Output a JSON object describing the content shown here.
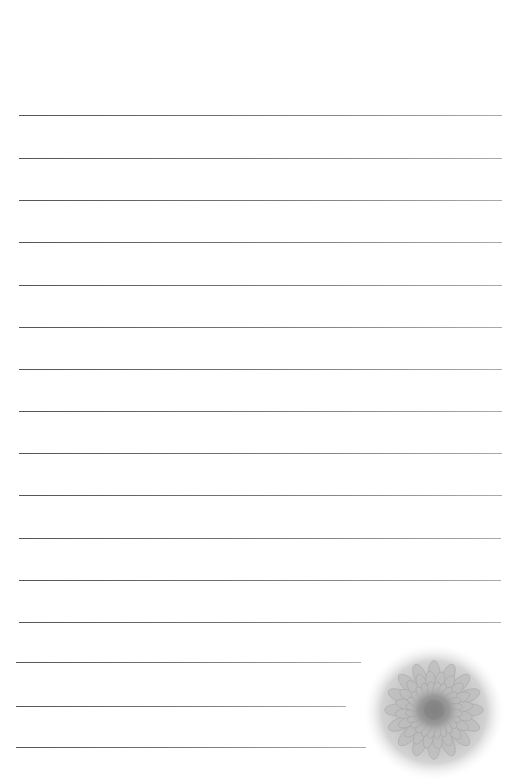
{
  "document": {
    "type": "lined-paper",
    "background_color": "#ffffff",
    "line_color": "#6e6e6e",
    "lines": [
      {
        "y": 115,
        "x1": 19,
        "x2": 502
      },
      {
        "y": 158,
        "x1": 19,
        "x2": 502
      },
      {
        "y": 200,
        "x1": 19,
        "x2": 502
      },
      {
        "y": 242,
        "x1": 19,
        "x2": 502
      },
      {
        "y": 285,
        "x1": 19,
        "x2": 502
      },
      {
        "y": 327,
        "x1": 19,
        "x2": 502
      },
      {
        "y": 369,
        "x1": 19,
        "x2": 502
      },
      {
        "y": 411,
        "x1": 19,
        "x2": 502
      },
      {
        "y": 453,
        "x1": 19,
        "x2": 502
      },
      {
        "y": 495,
        "x1": 19,
        "x2": 502
      },
      {
        "y": 538,
        "x1": 19,
        "x2": 501
      },
      {
        "y": 580,
        "x1": 19,
        "x2": 501
      },
      {
        "y": 622,
        "x1": 19,
        "x2": 501
      },
      {
        "y": 662,
        "x1": 16,
        "x2": 361
      },
      {
        "y": 706,
        "x1": 16,
        "x2": 346
      },
      {
        "y": 747,
        "x1": 16,
        "x2": 366
      }
    ],
    "decoration": {
      "name": "flower-image",
      "description": "grayscale chrysanthemum/gerbera flower, bottom-right corner"
    }
  }
}
